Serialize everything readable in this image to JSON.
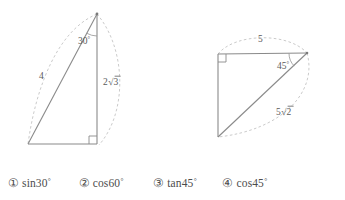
{
  "figures": [
    {
      "id": "triangle-30-60-90",
      "name": "right-triangle-with-30-degree-angle",
      "angle_label": "30",
      "angle_unit": "°",
      "hypotenuse_label": "4",
      "vertical_side_label": "2√3",
      "vertical_side_coefficient": "2",
      "vertical_side_radicand": "3",
      "right_angle_position": "bottom-right",
      "vertices": {
        "apex": [
          97,
          14
        ],
        "bottom_left": [
          28,
          144
        ],
        "bottom_right": [
          97,
          144
        ]
      }
    },
    {
      "id": "triangle-45-45-90",
      "name": "right-triangle-with-45-degree-angle",
      "angle_label": "45",
      "angle_unit": "°",
      "top_side_label": "5",
      "hypotenuse_label": "5√2",
      "hypotenuse_coefficient": "5",
      "hypotenuse_radicand": "2",
      "right_angle_position": "top-left",
      "vertices": {
        "top_left": [
          218,
          54
        ],
        "top_right": [
          307,
          53
        ],
        "bottom_left": [
          218,
          137
        ]
      }
    }
  ],
  "options": [
    {
      "marker": "①",
      "expression": "sin30",
      "degree": "°"
    },
    {
      "marker": "②",
      "expression": "cos60",
      "degree": "°"
    },
    {
      "marker": "③",
      "expression": "tan45",
      "degree": "°"
    },
    {
      "marker": "④",
      "expression": "cos45",
      "degree": "°"
    }
  ],
  "colors": {
    "figure_stroke": "#8a8a8a",
    "arc_stroke": "#c0c0c0",
    "text": "#4c4c4c",
    "background": "#ffffff"
  }
}
